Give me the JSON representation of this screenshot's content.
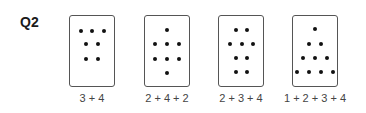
{
  "question": {
    "label": "Q2"
  },
  "cards": [
    {
      "caption": "3 + 4",
      "left": 69,
      "dots": [
        [
          81,
          31
        ],
        [
          92,
          31
        ],
        [
          104,
          31
        ],
        [
          86,
          44
        ],
        [
          98,
          44
        ],
        [
          86,
          59
        ],
        [
          98,
          59
        ]
      ]
    },
    {
      "caption": "2 + 4 + 2",
      "left": 144,
      "dots": [
        [
          167,
          30
        ],
        [
          155,
          44
        ],
        [
          167,
          44
        ],
        [
          179,
          44
        ],
        [
          155,
          59
        ],
        [
          167,
          59
        ],
        [
          179,
          59
        ],
        [
          167,
          73
        ]
      ]
    },
    {
      "caption": "2 + 3 + 4",
      "left": 218,
      "dots": [
        [
          236,
          30
        ],
        [
          247,
          30
        ],
        [
          230,
          44
        ],
        [
          242,
          44
        ],
        [
          253,
          44
        ],
        [
          236,
          58
        ],
        [
          247,
          58
        ],
        [
          236,
          72
        ],
        [
          247,
          72
        ]
      ]
    },
    {
      "caption": "1 + 2 + 3 + 4",
      "left": 292,
      "dots": [
        [
          315,
          29
        ],
        [
          309,
          44
        ],
        [
          321,
          44
        ],
        [
          303,
          58
        ],
        [
          315,
          58
        ],
        [
          327,
          58
        ],
        [
          297,
          72
        ],
        [
          309,
          72
        ],
        [
          321,
          72
        ],
        [
          333,
          72
        ]
      ]
    }
  ]
}
